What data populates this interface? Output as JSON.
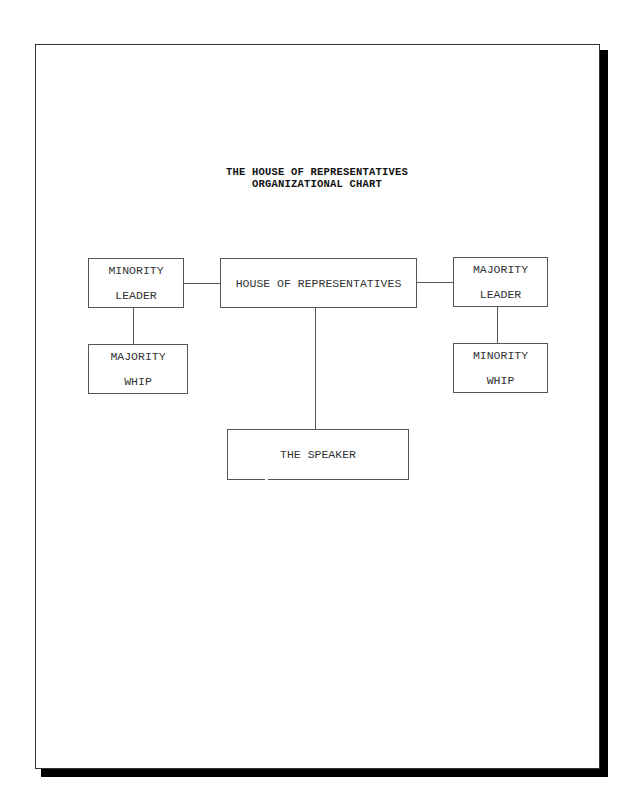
{
  "document": {
    "title_line1": "THE HOUSE OF REPRESENTATIVES",
    "title_line2": "ORGANIZATIONAL CHART"
  },
  "chart": {
    "nodes": {
      "house": {
        "label": "HOUSE OF REPRESENTATIVES"
      },
      "minority_leader": {
        "line1": "MINORITY",
        "line2": "LEADER"
      },
      "majority_whip": {
        "line1": "MAJORITY",
        "line2": "WHIP"
      },
      "majority_leader": {
        "line1": "MAJORITY",
        "line2": "LEADER"
      },
      "minority_whip": {
        "line1": "MINORITY",
        "line2": "WHIP"
      },
      "speaker": {
        "label": "THE SPEAKER"
      }
    },
    "edges": [
      {
        "from": "house",
        "to": "minority_leader"
      },
      {
        "from": "house",
        "to": "majority_leader"
      },
      {
        "from": "minority_leader",
        "to": "majority_whip"
      },
      {
        "from": "majority_leader",
        "to": "minority_whip"
      },
      {
        "from": "house",
        "to": "speaker"
      }
    ]
  },
  "colors": {
    "page_background": "#ffffff",
    "shadow": "#000000",
    "box_border": "#555555",
    "text": "#333333"
  }
}
